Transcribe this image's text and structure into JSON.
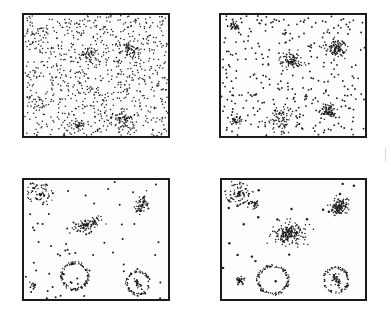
{
  "figure": {
    "ink_color": "#1a1a1a",
    "background": "#ffffff"
  },
  "panels": [
    {
      "id": "panel-1",
      "stage": 1,
      "box": {
        "x": 22,
        "y": 13,
        "w": 148,
        "h": 125
      },
      "background_dots": {
        "count": 900,
        "radius": 0.75,
        "seed": 11
      },
      "clusters": [
        {
          "type": "blob",
          "cx": 14,
          "cy": 17,
          "rx": 7,
          "ry": 5,
          "n": 18
        },
        {
          "type": "blob",
          "cx": 66,
          "cy": 40,
          "rx": 7,
          "ry": 9,
          "n": 35
        },
        {
          "type": "blob",
          "cx": 105,
          "cy": 34,
          "rx": 10,
          "ry": 9,
          "n": 70
        },
        {
          "type": "blob",
          "cx": 100,
          "cy": 103,
          "rx": 8,
          "ry": 8,
          "n": 55
        },
        {
          "type": "blob",
          "cx": 53,
          "cy": 112,
          "rx": 8,
          "ry": 5,
          "n": 28
        },
        {
          "type": "blob",
          "cx": 17,
          "cy": 90,
          "rx": 6,
          "ry": 8,
          "n": 14
        }
      ]
    },
    {
      "id": "panel-2",
      "stage": 2,
      "box": {
        "x": 219,
        "y": 13,
        "w": 148,
        "h": 125
      },
      "background_dots": {
        "count": 330,
        "radius": 0.9,
        "seed": 23
      },
      "clusters": [
        {
          "type": "blob",
          "cx": 13,
          "cy": 11,
          "rx": 5,
          "ry": 4,
          "n": 30
        },
        {
          "type": "blob",
          "cx": 70,
          "cy": 46,
          "rx": 12,
          "ry": 8,
          "n": 90
        },
        {
          "type": "blob",
          "cx": 115,
          "cy": 33,
          "rx": 10,
          "ry": 9,
          "n": 110
        },
        {
          "type": "blob",
          "cx": 107,
          "cy": 96,
          "rx": 8,
          "ry": 8,
          "n": 85
        },
        {
          "type": "blob",
          "cx": 15,
          "cy": 105,
          "rx": 5,
          "ry": 5,
          "n": 35
        },
        {
          "type": "blob",
          "cx": 58,
          "cy": 103,
          "rx": 14,
          "ry": 14,
          "n": 70
        }
      ]
    },
    {
      "id": "panel-3",
      "stage": 3,
      "box": {
        "x": 22,
        "y": 178,
        "w": 148,
        "h": 123
      },
      "background_dots": {
        "count": 75,
        "radius": 1.0,
        "seed": 37
      },
      "clusters": [
        {
          "type": "spiral",
          "cx": 16,
          "cy": 14,
          "r": 14,
          "n": 80
        },
        {
          "type": "blob",
          "cx": 118,
          "cy": 24,
          "rx": 6,
          "ry": 9,
          "n": 70,
          "angle": 20
        },
        {
          "type": "blob",
          "cx": 65,
          "cy": 44,
          "rx": 15,
          "ry": 5,
          "n": 100,
          "angle": -20
        },
        {
          "type": "ring",
          "cx": 51,
          "cy": 96,
          "rx": 14,
          "ry": 14,
          "n": 110
        },
        {
          "type": "ring",
          "cx": 114,
          "cy": 103,
          "rx": 12,
          "ry": 12,
          "n": 80
        },
        {
          "type": "blob",
          "cx": 114,
          "cy": 103,
          "rx": 3,
          "ry": 8,
          "n": 25,
          "angle": -30
        },
        {
          "type": "blob",
          "cx": 10,
          "cy": 106,
          "rx": 4,
          "ry": 4,
          "n": 20
        }
      ]
    },
    {
      "id": "panel-4",
      "stage": 4,
      "box": {
        "x": 220,
        "y": 178,
        "w": 147,
        "h": 123
      },
      "background_dots": {
        "count": 22,
        "radius": 1.2,
        "seed": 53
      },
      "clusters": [
        {
          "type": "spiral",
          "cx": 17,
          "cy": 14,
          "r": 16,
          "n": 120
        },
        {
          "type": "blob",
          "cx": 33,
          "cy": 24,
          "rx": 4,
          "ry": 4,
          "n": 25
        },
        {
          "type": "blob",
          "cx": 118,
          "cy": 26,
          "rx": 10,
          "ry": 7,
          "n": 130,
          "angle": -35
        },
        {
          "type": "blob",
          "cx": 68,
          "cy": 53,
          "rx": 17,
          "ry": 11,
          "n": 200,
          "angle": -10
        },
        {
          "type": "ring",
          "cx": 51,
          "cy": 100,
          "rx": 16,
          "ry": 15,
          "n": 130
        },
        {
          "type": "blob",
          "cx": 18,
          "cy": 101,
          "rx": 4,
          "ry": 4,
          "n": 45
        },
        {
          "type": "ring",
          "cx": 114,
          "cy": 100,
          "rx": 13,
          "ry": 13,
          "n": 90
        },
        {
          "type": "blob",
          "cx": 114,
          "cy": 100,
          "rx": 4,
          "ry": 8,
          "n": 45,
          "angle": -35
        }
      ]
    }
  ]
}
